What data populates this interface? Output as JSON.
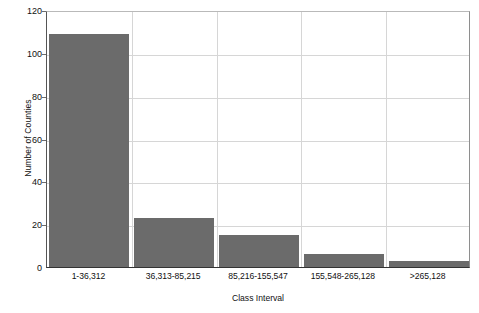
{
  "chart_data": {
    "type": "bar",
    "title": "",
    "xlabel": "Class Interval",
    "ylabel": "Number of Counties",
    "categories": [
      "1-36,312",
      "36,313-85,215",
      "85,216-155,547",
      "155,548-265,128",
      ">265,128"
    ],
    "values": [
      109,
      23,
      15,
      6,
      3
    ],
    "ylim": [
      0,
      120
    ],
    "yticks": [
      0,
      20,
      40,
      60,
      80,
      100,
      120
    ],
    "ytick_labels": [
      "0",
      "20",
      "40",
      "60",
      "80",
      "100",
      "120"
    ],
    "grid": "horizontal-and-vertical",
    "legend": "none",
    "bar_color": "#6b6b6b",
    "grid_color": "#d6d6d6",
    "axis_color": "#333333",
    "text_color": "#111111"
  }
}
